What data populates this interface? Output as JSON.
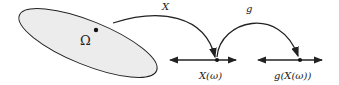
{
  "diagram": {
    "sample_space_label": "Ω",
    "map_X_label": "X",
    "map_g_label": "g",
    "point_X_label": "X(ω)",
    "point_g_label": "g(X(ω))",
    "colors": {
      "region_fill": "#ececec",
      "stroke": "#222222"
    }
  }
}
